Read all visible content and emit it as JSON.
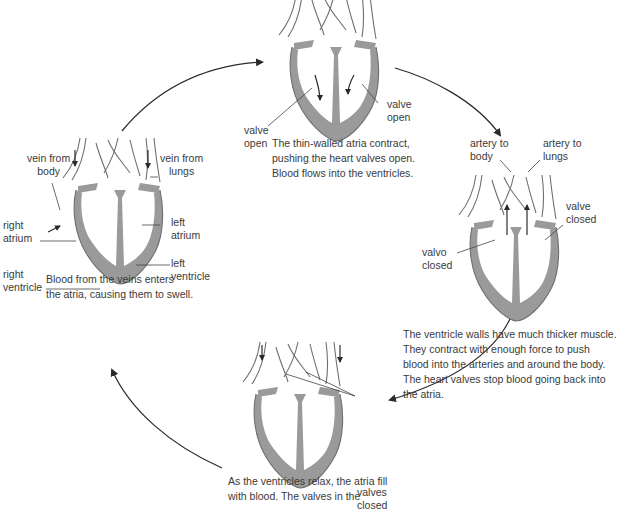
{
  "diagram": {
    "title_visible": false,
    "colors": {
      "muscle": "#9a9a9a",
      "outline": "#6f6f6f",
      "text": "#3a3a3a",
      "arrow": "#2a2a2a",
      "background": "#ffffff"
    },
    "stages": [
      {
        "id": "stage-1-atria-fill",
        "position": "left",
        "labels": {
          "vein_from_body": "vein from\nbody",
          "vein_from_lungs": "vein from\nlungs",
          "right_atrium": "right\natrium",
          "left_atrium": "left\natrium",
          "right_ventricle": "right\nventricle",
          "left_ventricle": "left\nventricle"
        },
        "caption": [
          "Blood from the veins enters",
          "the atria, causing them to swell."
        ]
      },
      {
        "id": "stage-2-atria-contract",
        "position": "top",
        "labels": {
          "valve_open_left": "valve\nopen",
          "valve_open_right": "valve\nopen"
        },
        "caption": [
          "The thin-walled atria contract,",
          "pushing the heart valves open.",
          "Blood flows into the ventricles."
        ]
      },
      {
        "id": "stage-3-ventricles-contract",
        "position": "right",
        "labels": {
          "artery_to_body": "artery to\nbody",
          "artery_to_lungs": "artery to\nlungs",
          "valve_closed_left": "valvo\nclosed",
          "valve_closed_right": "valve\nclosed"
        },
        "caption": [
          "The ventricle walls have much thicker muscle.",
          "They contract with enough force to push",
          "blood into the arteries and around the body.",
          "The heart valves stop blood going back into",
          "the atria."
        ]
      },
      {
        "id": "stage-4-ventricles-relax",
        "position": "bottom",
        "labels": {
          "valves_closed": "valves\nclosed"
        },
        "caption": [
          "As the ventricles relax, the atria fill",
          "with blood. The valves in the"
        ]
      }
    ],
    "cycle_arrows": [
      "left-to-top",
      "top-to-right",
      "right-to-bottom",
      "bottom-to-left"
    ]
  }
}
